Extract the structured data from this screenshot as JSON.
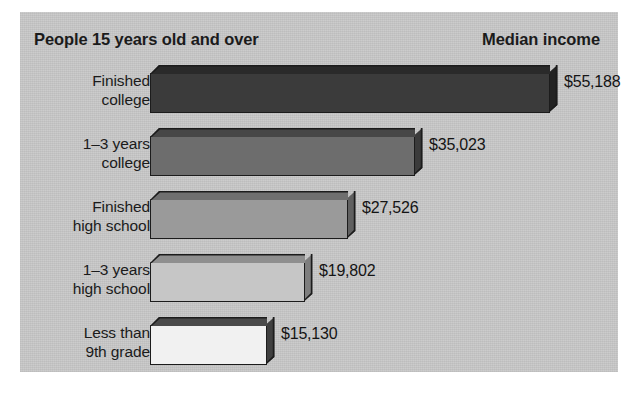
{
  "figure": {
    "header_left": "People 15 years old and over",
    "header_right": "Median income",
    "panel_color": "#c9c9c9",
    "outline_color": "#1c1c1c"
  },
  "chart_data": {
    "type": "bar",
    "orientation": "horizontal",
    "title": "People 15 years old and over",
    "subtitle": "Median income",
    "xlabel": "",
    "ylabel": "",
    "grid": false,
    "legend": "none",
    "value_prefix": "$",
    "categories": [
      "Finished college",
      "1–3 years college",
      "Finished high school",
      "1–3 years high school",
      "Less than 9th grade"
    ],
    "values": [
      55188,
      35023,
      27526,
      19802,
      15130
    ],
    "value_labels": [
      "$55,188",
      "$35,023",
      "$27,526",
      "$19,802",
      "$15,130"
    ],
    "bars": [
      {
        "label_line1": "Finished",
        "label_line2": "college",
        "value": 55188,
        "value_label": "$55,188",
        "bar_width_px": 400,
        "front_color": "#3b3b3b",
        "top_color": "#2a2a2a",
        "side_color": "#232323"
      },
      {
        "label_line1": "1–3 years",
        "label_line2": "college",
        "value": 35023,
        "value_label": "$35,023",
        "bar_width_px": 265,
        "front_color": "#6d6d6d",
        "top_color": "#474747",
        "side_color": "#3b3b3b"
      },
      {
        "label_line1": "Finished",
        "label_line2": "high school",
        "value": 27526,
        "value_label": "$27,526",
        "bar_width_px": 198,
        "front_color": "#9a9a9a",
        "top_color": "#6f6f6f",
        "side_color": "#606060"
      },
      {
        "label_line1": "1–3 years",
        "label_line2": "high school",
        "value": 19802,
        "value_label": "$19,802",
        "bar_width_px": 155,
        "front_color": "#c6c6c6",
        "top_color": "#8f8f8f",
        "side_color": "#7e7e7e"
      },
      {
        "label_line1": "Less than",
        "label_line2": "9th grade",
        "value": 15130,
        "value_label": "$15,130",
        "bar_width_px": 117,
        "front_color": "#f1f1f1",
        "top_color": "#4a4a4a",
        "side_color": "#3f3f3f"
      }
    ]
  }
}
